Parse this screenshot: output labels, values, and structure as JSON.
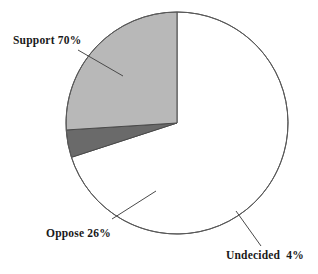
{
  "chart_data": {
    "type": "pie",
    "title": "",
    "categories": [
      "Support",
      "Oppose",
      "Undecided"
    ],
    "values": [
      70,
      26,
      4
    ],
    "value_unit": "%",
    "labels": [
      "Support 70%",
      "Oppose 26%",
      "Undecided  4%"
    ],
    "colors": [
      "#ffffff",
      "#b8b8b8",
      "#6a6a6a"
    ],
    "outline_color": "#4a4a4a",
    "start_angle_deg": 0,
    "direction": "clockwise",
    "legend": "none",
    "grid": false,
    "slices": [
      {
        "name": "Support",
        "label": "Support 70%",
        "value": 70,
        "percent_text": "70%",
        "color": "#ffffff",
        "start_deg": 0,
        "sweep_deg": 252
      },
      {
        "name": "Undecided",
        "label": "Undecided  4%",
        "value": 4,
        "percent_text": "4%",
        "color": "#6a6a6a",
        "start_deg": 252,
        "sweep_deg": 14.4
      },
      {
        "name": "Oppose",
        "label": "Oppose 26%",
        "value": 26,
        "percent_text": "26%",
        "color": "#b8b8b8",
        "start_deg": 266.4,
        "sweep_deg": 93.6
      }
    ]
  },
  "geometry": {
    "cx": 177,
    "cy": 123,
    "r": 111
  },
  "labels": {
    "support": "Support 70%",
    "oppose": "Oppose 26%",
    "undecided": "Undecided  4%"
  }
}
